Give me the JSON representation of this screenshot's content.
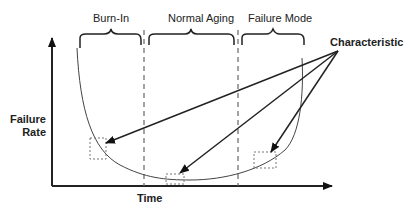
{
  "diagram": {
    "phases": [
      {
        "label": "Burn-In"
      },
      {
        "label": "Normal Aging"
      },
      {
        "label": "Failure Mode"
      }
    ],
    "callout": "Characteristic",
    "y_axis_label": [
      "Failure",
      "Rate"
    ],
    "x_axis_label": "Time"
  }
}
